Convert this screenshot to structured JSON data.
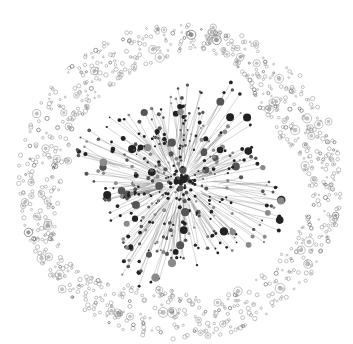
{
  "diagram": {
    "type": "network-graph",
    "center": [
      180,
      182
    ],
    "outer_radius": 162,
    "inner_gap_radius": 122,
    "colors": {
      "background": "#ffffff",
      "node_dark": "#222222",
      "node_mid": "#555555",
      "node_light": "#8a8a8a",
      "edge": "#6a6a6a",
      "ring_node": "#9a9a9a"
    },
    "counts": {
      "hub_nodes": 420,
      "ring_clusters": 900
    }
  }
}
